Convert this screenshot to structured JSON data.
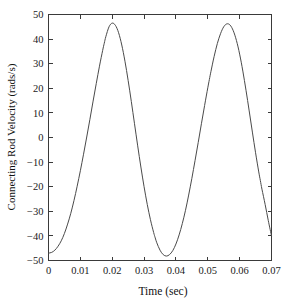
{
  "chart_data": {
    "type": "line",
    "title": "",
    "xlabel": "Time (sec)",
    "ylabel": "Connecting Rod Velocity (rads/s)",
    "xlim": [
      0,
      0.07
    ],
    "ylim": [
      -50,
      50
    ],
    "grid": false,
    "legend": null,
    "box": true,
    "line_color": "#4a4a4a",
    "xticks": [
      0,
      0.01,
      0.02,
      0.03,
      0.04,
      0.05,
      0.06,
      0.07
    ],
    "xtick_labels": [
      "0",
      "0.01",
      "0.02",
      "0.03",
      "0.04",
      "0.05",
      "0.06",
      "0.07"
    ],
    "yticks": [
      50,
      40,
      30,
      20,
      10,
      0,
      -10,
      -20,
      -30,
      -40,
      -50
    ],
    "ytick_labels": [
      "50",
      "40",
      "30",
      "20",
      "10",
      "0",
      "−10",
      "−20",
      "−30",
      "−40",
      "−50"
    ],
    "series": [
      {
        "name": "Connecting Rod Velocity",
        "x": [
          0,
          0.001,
          0.002,
          0.003,
          0.004,
          0.005,
          0.006,
          0.007,
          0.008,
          0.009,
          0.01,
          0.011,
          0.012,
          0.013,
          0.014,
          0.015,
          0.016,
          0.017,
          0.0175,
          0.018,
          0.019,
          0.02,
          0.021,
          0.022,
          0.023,
          0.024,
          0.025,
          0.026,
          0.027,
          0.028,
          0.029,
          0.03,
          0.031,
          0.032,
          0.033,
          0.0335,
          0.034,
          0.035,
          0.036,
          0.037,
          0.038,
          0.039,
          0.04,
          0.041,
          0.042,
          0.043,
          0.044,
          0.045,
          0.046,
          0.047,
          0.048,
          0.049,
          0.05,
          0.0505,
          0.051,
          0.052,
          0.053,
          0.054,
          0.055,
          0.056,
          0.057,
          0.058,
          0.059,
          0.06,
          0.061,
          0.062,
          0.063,
          0.064,
          0.065,
          0.066,
          0.0665,
          0.067,
          0.068,
          0.069,
          0.07
        ],
        "y": [
          -47.0,
          -46.7,
          -45.8,
          -44.2,
          -42.0,
          -39.0,
          -35.2,
          -30.8,
          -25.6,
          -19.8,
          -13.5,
          -6.8,
          0.2,
          7.4,
          14.8,
          22.0,
          29.0,
          35.4,
          38.3,
          41.0,
          45.0,
          46.5,
          45.6,
          42.6,
          37.6,
          31.0,
          23.2,
          14.6,
          5.6,
          -3.4,
          -12.0,
          -20.0,
          -27.2,
          -33.4,
          -38.6,
          -40.8,
          -42.8,
          -45.8,
          -47.6,
          -48.2,
          -47.6,
          -46.0,
          -43.3,
          -39.6,
          -35.0,
          -29.6,
          -23.4,
          -16.6,
          -9.4,
          -2.0,
          5.6,
          13.0,
          20.2,
          23.6,
          26.9,
          33.0,
          38.2,
          42.2,
          45.0,
          46.2,
          45.7,
          43.4,
          39.4,
          33.9,
          27.0,
          19.2,
          10.8,
          2.2,
          -6.2,
          -14.0,
          -17.5,
          -21.0,
          -27.2,
          -33.8,
          -40.0
        ]
      }
    ]
  },
  "axes": {
    "xlabel": "Time (sec)",
    "ylabel": "Connecting Rod Velocity (rads/s)"
  }
}
